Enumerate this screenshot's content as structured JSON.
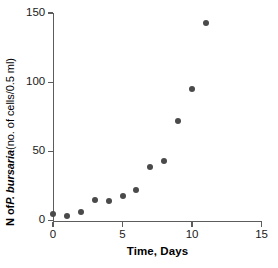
{
  "chart_data": {
    "type": "scatter",
    "title": "",
    "xlabel": "Time, Days",
    "ylabel": "N of P. bursaria (no. of cells/0.5 ml)",
    "ylabel_parts": {
      "prefix": "N of ",
      "species": "P. bursaria",
      "suffix": " (no. of cells/0.5 ml)"
    },
    "x": [
      0,
      1,
      2,
      3,
      4,
      5,
      6,
      7,
      8,
      9,
      10,
      11
    ],
    "values": [
      5,
      3,
      6,
      15,
      14,
      18,
      22,
      39,
      43,
      72,
      95,
      143
    ],
    "series": [
      {
        "name": "P. bursaria",
        "marker": "filled-circle",
        "color": "#4a4a4a",
        "values": [
          5,
          3,
          6,
          15,
          14,
          18,
          22,
          39,
          43,
          72,
          95,
          143
        ]
      }
    ],
    "xlim": [
      0,
      15
    ],
    "ylim": [
      0,
      150
    ],
    "xticks": [
      0,
      5,
      10,
      15
    ],
    "xtick_labels": [
      "0",
      "5",
      "10",
      "15"
    ],
    "yticks": [
      0,
      50,
      100,
      150
    ],
    "ytick_labels": [
      "0",
      "50",
      "100",
      "150"
    ],
    "grid": false,
    "legend": "none",
    "axis_color": "#5c5c5c",
    "text_color": "#1a1a1a"
  }
}
